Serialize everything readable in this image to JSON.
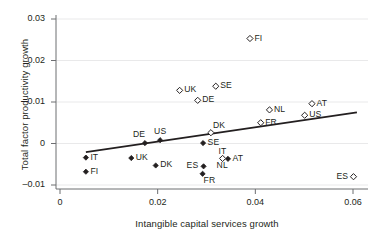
{
  "chart_data": {
    "type": "scatter",
    "title": "",
    "xlabel": "Intangible capital services growth",
    "ylabel": "Total factor productivity growth",
    "xlim": [
      -0.0008,
      0.0645
    ],
    "ylim": [
      -0.0115,
      0.0318
    ],
    "xticks": [
      0,
      0.02,
      0.04,
      0.06
    ],
    "xticklabels": [
      "0",
      "0.02",
      "0.04",
      "0.06"
    ],
    "yticks": [
      -0.01,
      0,
      0.01,
      0.02,
      0.03
    ],
    "yticklabels": [
      "–0.01",
      "0",
      "0.01",
      "0.02",
      "0.03"
    ],
    "grid": true,
    "legend": null,
    "series": [
      {
        "name": "filled",
        "marker": "filled-diamond",
        "points": [
          {
            "label": "IT",
            "x": 0.0053,
            "y": -0.0034,
            "label_pos": "right"
          },
          {
            "label": "FI",
            "x": 0.0053,
            "y": -0.0068,
            "label_pos": "right"
          },
          {
            "label": "UK",
            "x": 0.0146,
            "y": -0.0035,
            "label_pos": "right"
          },
          {
            "label": "DE",
            "x": 0.0174,
            "y": 0.0001,
            "label_pos": "above-left"
          },
          {
            "label": "DK",
            "x": 0.0196,
            "y": -0.0053,
            "label_pos": "right"
          },
          {
            "label": "US",
            "x": 0.0205,
            "y": 0.0008,
            "label_pos": "above"
          },
          {
            "label": "SE",
            "x": 0.0293,
            "y": 0.0001,
            "label_pos": "right"
          },
          {
            "label": "ES",
            "x": 0.0294,
            "y": -0.0055,
            "label_pos": "left"
          },
          {
            "label": "FR",
            "x": 0.0292,
            "y": -0.0073,
            "label_pos": "below-right"
          },
          {
            "label": "AT",
            "x": 0.0344,
            "y": -0.0037,
            "label_pos": "right"
          }
        ]
      },
      {
        "name": "hollow",
        "marker": "hollow-diamond",
        "points": [
          {
            "label": "UK",
            "x": 0.0245,
            "y": 0.0128,
            "label_pos": "right"
          },
          {
            "label": "DE",
            "x": 0.0282,
            "y": 0.0104,
            "label_pos": "right"
          },
          {
            "label": "SE",
            "x": 0.0319,
            "y": 0.0138,
            "label_pos": "right"
          },
          {
            "label": "DK",
            "x": 0.0309,
            "y": 0.0026,
            "label_pos": "above-right"
          },
          {
            "label": "FI",
            "x": 0.0389,
            "y": 0.0253,
            "label_pos": "right"
          },
          {
            "label": "FR",
            "x": 0.0411,
            "y": 0.005,
            "label_pos": "right"
          },
          {
            "label": "NL",
            "x": 0.0429,
            "y": 0.0081,
            "label_pos": "right"
          },
          {
            "label": "US",
            "x": 0.0501,
            "y": 0.0068,
            "label_pos": "right"
          },
          {
            "label": "AT",
            "x": 0.0516,
            "y": 0.0096,
            "label_pos": "right"
          },
          {
            "label": "ES",
            "x": 0.0601,
            "y": -0.008,
            "label_pos": "left"
          },
          {
            "label": "NL",
            "x": 0.0333,
            "y": -0.0036,
            "label_pos": "below"
          }
        ]
      }
    ],
    "trendline": {
      "x_start": 0.0053,
      "y_start": -0.0021,
      "x_end": 0.0608,
      "y_end": 0.0075
    },
    "extra_labels": [
      {
        "text": "IT",
        "x": 0.0335,
        "y": -0.0018
      }
    ]
  }
}
